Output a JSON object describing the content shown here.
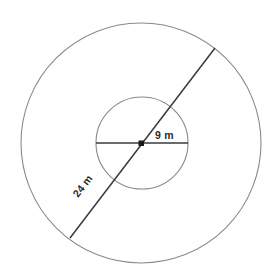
{
  "figure": {
    "background_color": "#ffffff",
    "stroke_color_circle": "#8a8a8a",
    "stroke_color_line": "#3a3a3a",
    "label_color": "#2b2b2b",
    "center": {
      "x": 141,
      "y": 143
    },
    "outer_circle": {
      "name": "outer-circle",
      "radius": 120,
      "cx": 141,
      "cy": 143
    },
    "inner_circle": {
      "name": "inner-circle",
      "radius": 46,
      "cx": 142,
      "cy": 143
    },
    "center_point": {
      "name": "center-point",
      "size": 5
    },
    "radius_segment": {
      "name": "inner-diameter-segment",
      "x1": 96,
      "y1": 143,
      "x2": 188,
      "y2": 143
    },
    "diameter_segment": {
      "name": "outer-diameter-segment",
      "x1": 70,
      "y1": 238,
      "x2": 215,
      "y2": 48,
      "angle_deg": -52.6
    },
    "labels": [
      {
        "id": "inner-radius-label",
        "text": "9 m",
        "x": 155,
        "y": 139,
        "rotation": 0
      },
      {
        "id": "outer-radius-label",
        "text": "24 m",
        "x": 78,
        "y": 198,
        "rotation": -52.6
      }
    ]
  }
}
